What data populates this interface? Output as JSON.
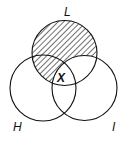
{
  "diagram": {
    "type": "venn-3",
    "sets": [
      {
        "id": "L",
        "label": "L",
        "cx": 64.5,
        "cy": 53,
        "r": 32.5
      },
      {
        "id": "H",
        "label": "H",
        "cx": 43,
        "cy": 88,
        "r": 33
      },
      {
        "id": "I",
        "label": "I",
        "cx": 84.5,
        "cy": 88,
        "r": 32.5
      }
    ],
    "shaded_region": "L minus I",
    "marked_region": {
      "label": "X",
      "region": "L ∩ H ∩ I"
    },
    "colors": {
      "stroke": "#111111",
      "hatch": "#222222",
      "background": "#ffffff"
    }
  },
  "labels": {
    "L": "L",
    "H": "H",
    "I": "I",
    "X": "X"
  }
}
